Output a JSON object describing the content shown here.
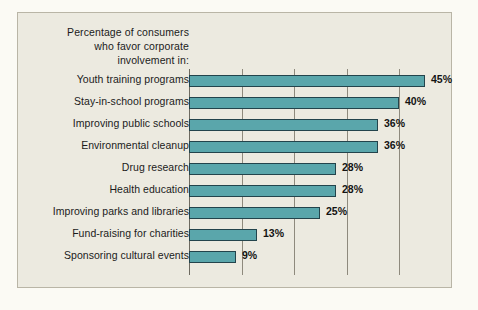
{
  "figure": {
    "background_color": "#fbfaf4",
    "panel_color": "#eceae0",
    "panel_border_color": "#b9b5a6",
    "bar_color": "#5aa6ab",
    "bar_edge_color": "#23444c",
    "gridline_color": "#8e8a7d",
    "axis_color": "#6d6a60"
  },
  "title": {
    "lines": [
      "Percentage of consumers",
      "who favor corporate",
      "involvement in:"
    ]
  },
  "chart_data": {
    "type": "bar",
    "orientation": "horizontal",
    "title": "Percentage of consumers who favor corporate involvement in:",
    "xlabel": "",
    "ylabel": "",
    "xlim": [
      0,
      48
    ],
    "grid": true,
    "gridlines_at": [
      10,
      20,
      30,
      40
    ],
    "legend": null,
    "categories": [
      "Youth training programs",
      "Stay-in-school programs",
      "Improving public schools",
      "Environmental cleanup",
      "Drug research",
      "Health education",
      "Improving parks and libraries",
      "Fund-raising for charities",
      "Sponsoring cultural events"
    ],
    "values": [
      45,
      40,
      36,
      36,
      28,
      28,
      25,
      13,
      9
    ],
    "value_labels": [
      "45%",
      "40%",
      "36%",
      "36%",
      "28%",
      "28%",
      "25%",
      "13%",
      "9%"
    ]
  }
}
